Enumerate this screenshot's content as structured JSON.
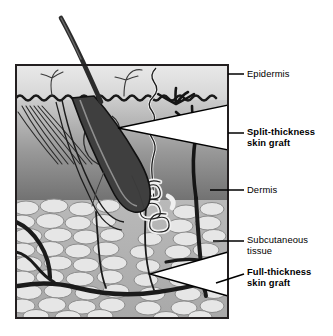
{
  "figure": {
    "frame": {
      "x": 16,
      "y": 65,
      "width": 212,
      "height": 253
    }
  },
  "colors": {
    "background": "#ffffff",
    "text": "#000000",
    "frame_border": "#231f20",
    "epidermis_light": "#ebebeb",
    "epidermis_dark": "#cfcfcf",
    "dermis_light": "#c8c8c8",
    "dermis_dark": "#6e6e6e",
    "subcutaneous_fill": "#b4b4b4",
    "fat_lobule": "#e4e4e4",
    "fat_outline": "#8a8a8a",
    "vessel": "#1a1a1a",
    "hair": "#2a2a2a",
    "leader_line": "#000000",
    "graft_wedge": "#ffffff"
  },
  "labels": [
    {
      "id": "epidermis",
      "text": "Epidermis",
      "bold": false,
      "x": 247,
      "y": 68,
      "leader": {
        "x1": 228,
        "y1": 74,
        "x2": 244,
        "y2": 74
      }
    },
    {
      "id": "split-thickness-skin-graft",
      "text": "Split-thickness\nskin graft",
      "bold": true,
      "x": 247,
      "y": 126,
      "leader": {
        "x1": 228,
        "y1": 133,
        "x2": 244,
        "y2": 133
      }
    },
    {
      "id": "dermis",
      "text": "Dermis",
      "bold": false,
      "x": 247,
      "y": 184,
      "leader": {
        "x1": 210,
        "y1": 190,
        "x2": 244,
        "y2": 190
      }
    },
    {
      "id": "subcutaneous-tissue",
      "text": "Subcutaneous\ntissue",
      "bold": false,
      "x": 247,
      "y": 234,
      "leader": {
        "x1": 213,
        "y1": 241,
        "x2": 244,
        "y2": 241
      }
    },
    {
      "id": "full-thickness-skin-graft",
      "text": "Full-thickness\nskin graft",
      "bold": true,
      "x": 247,
      "y": 270,
      "leader": {
        "x1": 216,
        "y1": 283,
        "x2": 244,
        "y2": 274
      }
    }
  ],
  "structures": [
    {
      "id": "hair-shaft",
      "label": "hair shaft"
    },
    {
      "id": "hair-follicle",
      "label": "hair follicle"
    },
    {
      "id": "sebaceous-gland",
      "label": "sebaceous gland"
    },
    {
      "id": "sweat-gland-coil",
      "label": "coiled sweat gland"
    },
    {
      "id": "sweat-duct",
      "label": "sweat duct"
    },
    {
      "id": "arrector-pili-muscle",
      "label": "arrector pili muscle"
    },
    {
      "id": "dermal-papillae",
      "label": "dermal-epidermal junction"
    },
    {
      "id": "blood-vessel-network",
      "label": "blood vessels"
    },
    {
      "id": "fat-lobules",
      "label": "subcutaneous fat lobules"
    },
    {
      "id": "split-thickness-wedge",
      "label": "split-thickness graft depth wedge"
    },
    {
      "id": "full-thickness-wedge",
      "label": "full-thickness graft depth wedge"
    }
  ]
}
